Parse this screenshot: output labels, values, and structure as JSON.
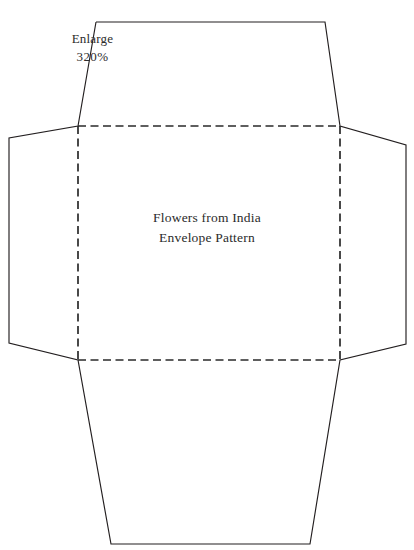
{
  "document": {
    "title": "Flowers from India Envelope Pattern",
    "background_color": "#ffffff",
    "ink_color": "#231f20",
    "width": 414,
    "height": 550
  },
  "annotations": {
    "enlarge": {
      "line1": "Enlarge",
      "line2": "320%"
    },
    "center": {
      "line1": "Flowers from India",
      "line2": "Envelope Pattern"
    }
  },
  "pattern": {
    "type": "envelope-template",
    "cut_line_style": "solid",
    "fold_line_style": "dashed",
    "panels": [
      {
        "name": "top-flap",
        "points": "96,22 325,22 340,126 78,126"
      },
      {
        "name": "left-flap",
        "points": "78,126 9,138 9,343 78,360"
      },
      {
        "name": "right-flap",
        "points": "340,126 406,145 406,344 340,360"
      },
      {
        "name": "bottom-flap",
        "points": "78,360 340,360 310,544 111,544"
      },
      {
        "name": "center-panel",
        "points": "78,126 340,126 340,360 78,360"
      }
    ],
    "outline": "96,22 325,22 340,126 406,145 406,344 340,360 310,544 111,544 78,360 9,343 9,138 78,126 96,22",
    "folds": [
      {
        "name": "fold-top",
        "from": "78,126",
        "to": "340,126"
      },
      {
        "name": "fold-bottom",
        "from": "78,360",
        "to": "340,360"
      },
      {
        "name": "fold-left",
        "from": "78,126",
        "to": "78,360"
      },
      {
        "name": "fold-right",
        "from": "340,126",
        "to": "340,360"
      }
    ]
  }
}
